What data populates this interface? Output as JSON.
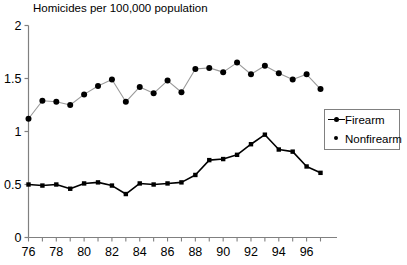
{
  "chart_data": {
    "type": "line",
    "title": "Homicides per 100,000 population",
    "xlabel": "",
    "ylabel": "",
    "ylim": [
      0,
      2
    ],
    "yticks": [
      "0",
      "0.5",
      "1",
      "1.5",
      "2"
    ],
    "ytick_values": [
      0,
      0.5,
      1,
      1.5,
      2
    ],
    "xlim": [
      76,
      97
    ],
    "xticks": [
      "76",
      "78",
      "80",
      "82",
      "84",
      "86",
      "88",
      "90",
      "92",
      "94",
      "96"
    ],
    "xtick_values": [
      76,
      78,
      80,
      82,
      84,
      86,
      88,
      90,
      92,
      94,
      96
    ],
    "x": [
      76,
      77,
      78,
      79,
      80,
      81,
      82,
      83,
      84,
      85,
      86,
      87,
      88,
      89,
      90,
      91,
      92,
      93,
      94,
      95,
      96,
      97
    ],
    "grid": false,
    "legend_position": "right",
    "series": [
      {
        "name": "Firearm",
        "marker": "square",
        "values": [
          0.5,
          0.49,
          0.5,
          0.46,
          0.51,
          0.52,
          0.49,
          0.41,
          0.51,
          0.5,
          0.51,
          0.52,
          0.59,
          0.73,
          0.74,
          0.78,
          0.88,
          0.97,
          0.83,
          0.81,
          0.67,
          0.61
        ]
      },
      {
        "name": "Nonfirearm",
        "marker": "circle",
        "values": [
          1.12,
          1.29,
          1.28,
          1.25,
          1.35,
          1.43,
          1.49,
          1.28,
          1.42,
          1.36,
          1.48,
          1.37,
          1.59,
          1.6,
          1.56,
          1.65,
          1.54,
          1.62,
          1.55,
          1.49,
          1.54,
          1.4
        ]
      }
    ]
  },
  "legend": {
    "items": [
      {
        "label": "Firearm",
        "key": "line-marker-key"
      },
      {
        "label": "Nonfirearm",
        "key": "dot-marker-key"
      }
    ]
  },
  "colors": {
    "series_firearm": "#000000",
    "series_nonfirearm": "#9a9a9a",
    "axis": "#808080",
    "marker": "#000000",
    "background": "#ffffff"
  }
}
